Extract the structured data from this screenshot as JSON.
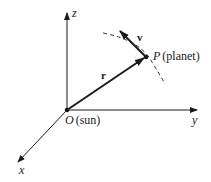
{
  "diagram": {
    "axes": {
      "z": {
        "label": "z"
      },
      "y": {
        "label": "y"
      },
      "x": {
        "label": "x"
      }
    },
    "origin": {
      "symbol": "O",
      "description": "(sun)"
    },
    "planet": {
      "symbol": "P",
      "description": "(planet)"
    },
    "vectors": {
      "position": {
        "label": "r"
      },
      "velocity": {
        "label": "v"
      }
    },
    "orbit": {
      "style": "dashed"
    },
    "colors": {
      "ink": "#1a1a1a",
      "background": "#ffffff"
    }
  }
}
